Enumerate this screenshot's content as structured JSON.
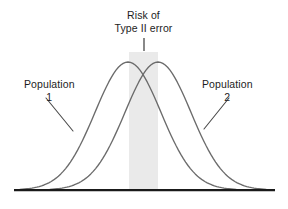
{
  "figure": {
    "title_lines": [
      "Risk of",
      "Type II error"
    ],
    "background_color": "#ffffff",
    "curve_color": "#6b6b6b",
    "shade_color": "#eaeaea",
    "axis_color": "#1a1a1a",
    "text_color": "#1d1d1d"
  },
  "labels": {
    "population_1": {
      "name": "Population",
      "number": "1"
    },
    "population_2": {
      "name": "Population",
      "number": "2"
    }
  },
  "chart_data": {
    "type": "line",
    "title": "Risk of Type II error",
    "xlabel": "",
    "ylabel": "",
    "grid": false,
    "legend_position": "inline-annotations",
    "xlim": [
      0,
      288
    ],
    "ylim": [
      0,
      209
    ],
    "baseline_y": 190,
    "axis_x_range": [
      14,
      275
    ],
    "shaded_region": {
      "label": "Risk of Type II error",
      "x_start": 129,
      "x_end": 158,
      "color": "#eaeaea"
    },
    "pointer_tick": {
      "x": 144,
      "y_top": 38,
      "y_bottom": 51
    },
    "series": [
      {
        "name": "Population 1",
        "mean_x": 128,
        "peak_y": 62,
        "sigma_x": 33,
        "x_start": 20,
        "x_end": 236
      },
      {
        "name": "Population 2",
        "mean_x": 158,
        "peak_y": 62,
        "sigma_x": 33,
        "x_start": 50,
        "x_end": 266
      }
    ],
    "annotations": [
      {
        "text": "Population 1",
        "leader_from": [
          46,
          98
        ],
        "leader_to": [
          73,
          131
        ]
      },
      {
        "text": "Population 2",
        "leader_from": [
          229,
          98
        ],
        "leader_to": [
          204,
          129
        ]
      }
    ]
  }
}
